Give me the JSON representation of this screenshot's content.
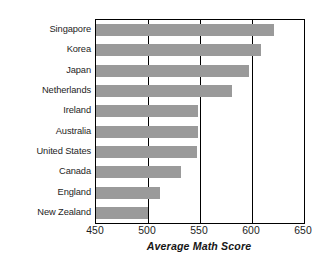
{
  "chart_data": {
    "type": "bar",
    "orientation": "horizontal",
    "title": "",
    "xlabel": "Average Math Score",
    "ylabel": "",
    "categories": [
      "Singapore",
      "Korea",
      "Japan",
      "Netherlands",
      "Ireland",
      "Australia",
      "United States",
      "Canada",
      "England",
      "New Zealand"
    ],
    "values": [
      621,
      609,
      597,
      581,
      548,
      548,
      547,
      532,
      512,
      500
    ],
    "xlim": [
      450,
      650
    ],
    "xticks": [
      450,
      500,
      550,
      600,
      650
    ],
    "xtick_labels": [
      "450",
      "500",
      "550",
      "600",
      "650"
    ],
    "gridlines_x": [
      500,
      550,
      600
    ],
    "grid": true,
    "legend": false,
    "bar_color": "#9a9a9a",
    "axis_color": "#000000",
    "background_color": "#ffffff"
  }
}
